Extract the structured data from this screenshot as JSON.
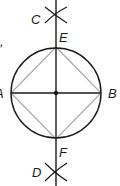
{
  "diagram": {
    "labels": {
      "C": "C",
      "E": "E",
      "A": "A",
      "B": "B",
      "F": "F",
      "D": "D",
      "fragment": ","
    },
    "colors": {
      "stroke": "#1a1a1a",
      "square": "#a8a8a8",
      "background": "#ffffff"
    }
  }
}
